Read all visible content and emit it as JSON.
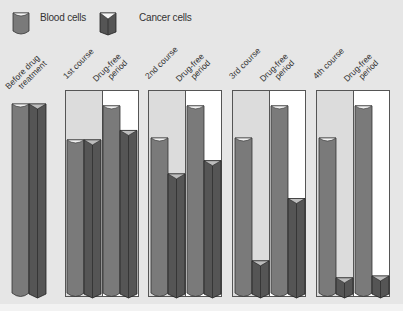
{
  "legend": {
    "blood_label": "Blood cells",
    "cancer_label": "Cancer cells"
  },
  "columns": [
    {
      "label_line1": "Before drug",
      "label_line2": "treatment"
    },
    {
      "label_line1": "1st course",
      "label_line2": ""
    },
    {
      "label_line1": "Drug-free",
      "label_line2": "period"
    },
    {
      "label_line1": "2nd course",
      "label_line2": ""
    },
    {
      "label_line1": "Drug-free",
      "label_line2": "period"
    },
    {
      "label_line1": "3rd course",
      "label_line2": ""
    },
    {
      "label_line1": "Drug-free",
      "label_line2": "period"
    },
    {
      "label_line1": "4th course",
      "label_line2": ""
    },
    {
      "label_line1": "Drug-free",
      "label_line2": "period"
    }
  ],
  "colors": {
    "blood": "#7a7a7a",
    "cancer": "#555555",
    "background": "#e6e6e6",
    "drug_free_bg": "#ffffff"
  },
  "chart_data": {
    "type": "bar",
    "title": "",
    "categories": [
      "Before drug treatment",
      "1st course",
      "Drug-free period",
      "2nd course",
      "Drug-free period",
      "3rd course",
      "Drug-free period",
      "4th course",
      "Drug-free period"
    ],
    "series": [
      {
        "name": "Blood cells",
        "values": [
          100,
          81,
          99,
          82,
          99,
          82,
          99,
          82,
          99
        ]
      },
      {
        "name": "Cancer cells",
        "values": [
          100,
          81,
          86,
          63,
          70,
          17,
          50,
          8,
          9
        ]
      }
    ],
    "xlabel": "",
    "ylabel": "",
    "ylim": [
      0,
      100
    ],
    "grid": false,
    "legend_position": "top"
  }
}
